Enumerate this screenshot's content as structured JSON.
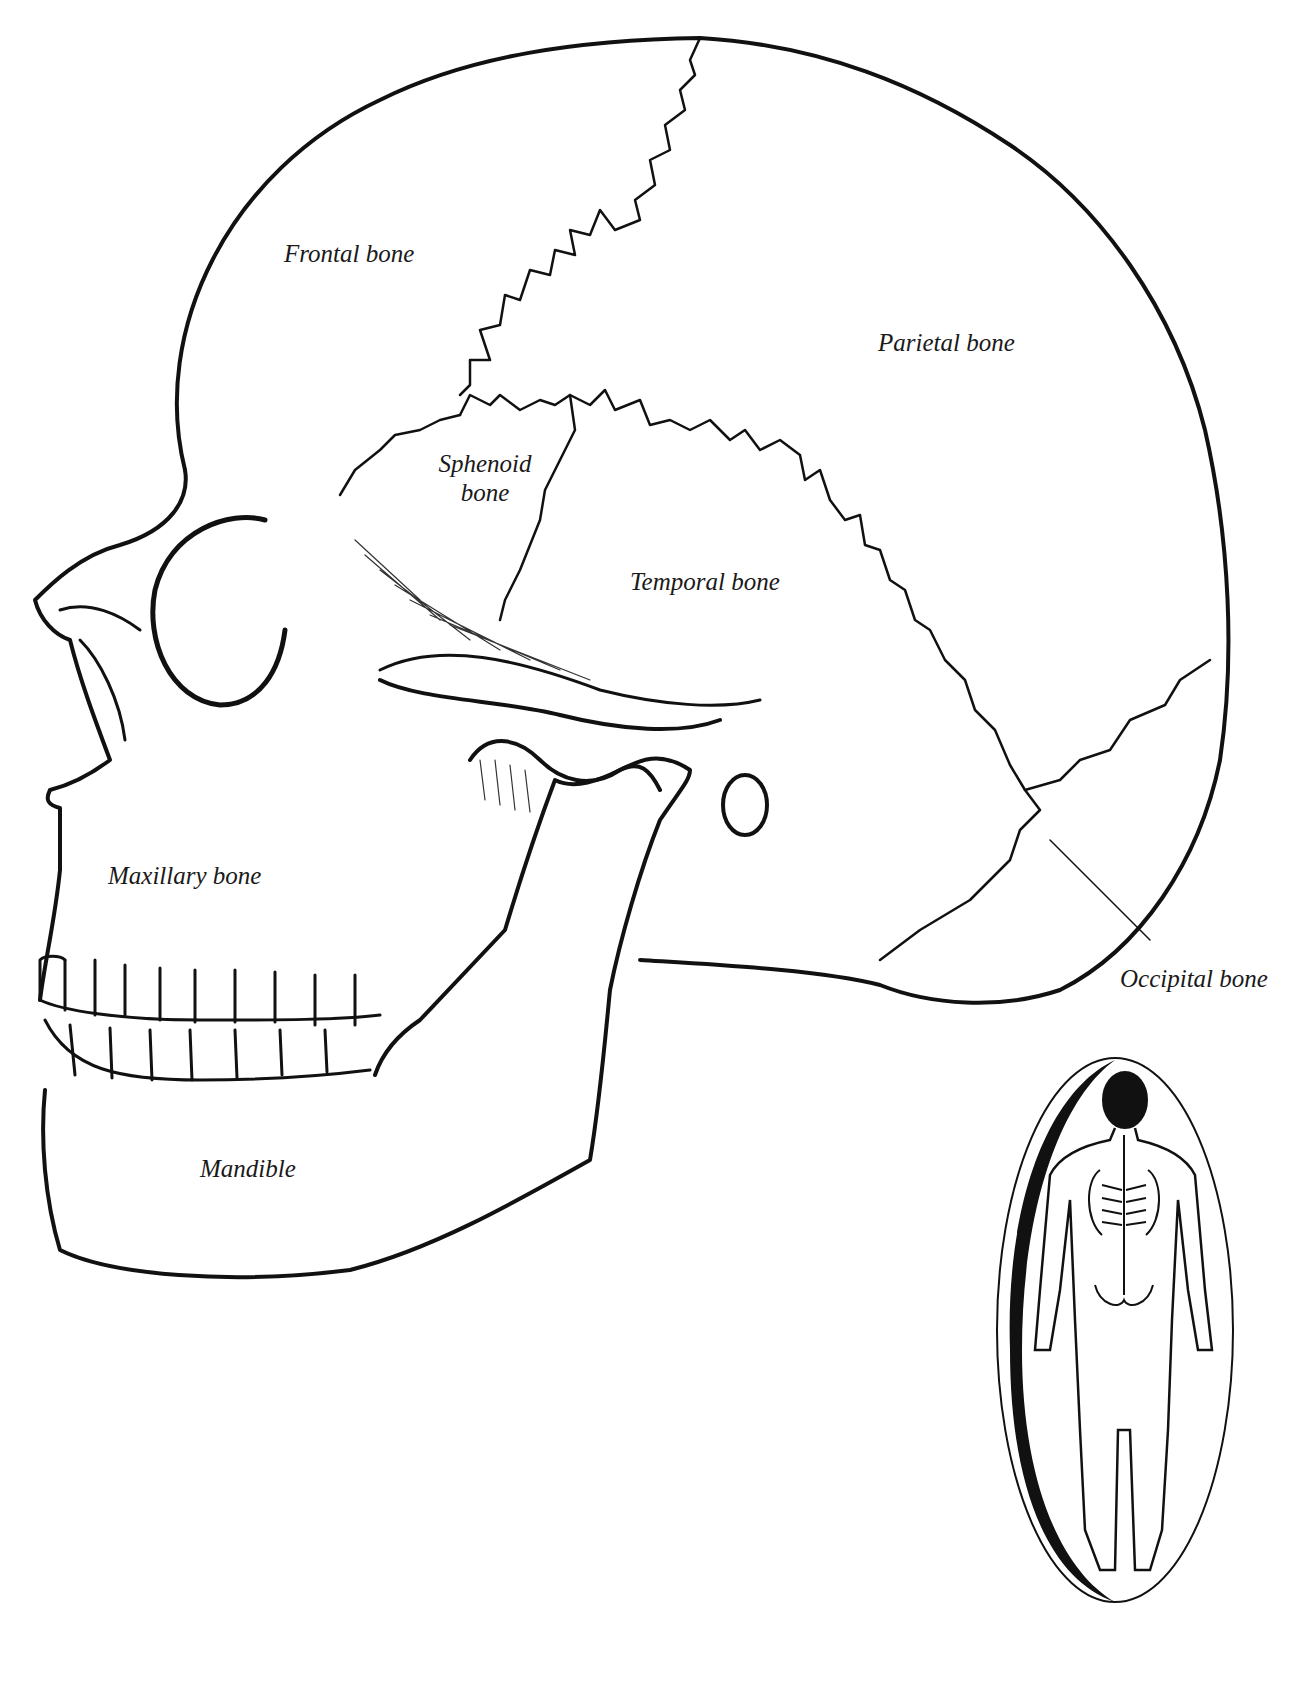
{
  "diagram": {
    "type": "anatomical-illustration",
    "labels": {
      "frontal": "Frontal bone",
      "parietal": "Parietal bone",
      "sphenoid_line1": "Sphenoid",
      "sphenoid_line2": "bone",
      "temporal": "Temporal bone",
      "maxillary": "Maxillary bone",
      "mandible": "Mandible",
      "occipital": "Occipital bone"
    },
    "inset": {
      "description": "Full-body skeleton figure in oval with skull highlighted"
    },
    "colors": {
      "ink": "#111111",
      "paper": "#ffffff",
      "label_text": "#1a1a1a"
    }
  }
}
